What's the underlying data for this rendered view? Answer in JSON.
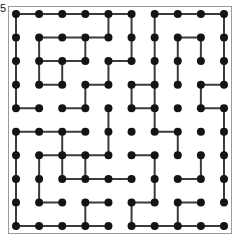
{
  "figure": {
    "caption": "5",
    "grid": {
      "rows": 10,
      "cols": 10,
      "origin_x": 14,
      "origin_y": 14,
      "step_x": 22.0,
      "step_y": 22.2
    },
    "style": {
      "dot_color": "#141414",
      "edge_color": "#3b3b3b",
      "frame_color": "#9a9a9a",
      "background": "#ffffff",
      "dot_radius": 4.0,
      "edge_width": 2.0
    },
    "chart_data": {
      "type": "scatter",
      "title": "Dot lattice maze diagram",
      "xlabel": "",
      "ylabel": "",
      "xlim": [
        0,
        9
      ],
      "ylim": [
        0,
        9
      ],
      "grid": false,
      "legend": "none",
      "note": "10x10 lattice of filled dots; selected orthogonal unit segments join neighbouring dots forming a maze-like pattern.",
      "nodes_per_row": 10,
      "nodes_per_col": 10,
      "horizontal_edges": [
        {
          "row": 0,
          "from": 0,
          "to": 5
        },
        {
          "row": 0,
          "from": 6,
          "to": 9
        },
        {
          "row": 1,
          "from": 1,
          "to": 4
        },
        {
          "row": 1,
          "from": 7,
          "to": 8
        },
        {
          "row": 2,
          "from": 1,
          "to": 3
        },
        {
          "row": 2,
          "from": 4,
          "to": 5
        },
        {
          "row": 3,
          "from": 1,
          "to": 2
        },
        {
          "row": 3,
          "from": 3,
          "to": 4
        },
        {
          "row": 3,
          "from": 5,
          "to": 6
        },
        {
          "row": 3,
          "from": 8,
          "to": 9
        },
        {
          "row": 4,
          "from": 0,
          "to": 1
        },
        {
          "row": 4,
          "from": 2,
          "to": 3
        },
        {
          "row": 4,
          "from": 5,
          "to": 6
        },
        {
          "row": 4,
          "from": 8,
          "to": 9
        },
        {
          "row": 5,
          "from": 0,
          "to": 3
        },
        {
          "row": 5,
          "from": 6,
          "to": 7
        },
        {
          "row": 6,
          "from": 1,
          "to": 4
        },
        {
          "row": 6,
          "from": 5,
          "to": 6
        },
        {
          "row": 7,
          "from": 2,
          "to": 5
        },
        {
          "row": 7,
          "from": 7,
          "to": 8
        },
        {
          "row": 8,
          "from": 1,
          "to": 2
        },
        {
          "row": 8,
          "from": 3,
          "to": 4
        },
        {
          "row": 8,
          "from": 5,
          "to": 6
        },
        {
          "row": 8,
          "from": 7,
          "to": 8
        },
        {
          "row": 9,
          "from": 0,
          "to": 4
        },
        {
          "row": 9,
          "from": 5,
          "to": 9
        }
      ],
      "vertical_edges": [
        {
          "col": 0,
          "from": 0,
          "to": 4
        },
        {
          "col": 0,
          "from": 5,
          "to": 9
        },
        {
          "col": 1,
          "from": 1,
          "to": 3
        },
        {
          "col": 1,
          "from": 6,
          "to": 8
        },
        {
          "col": 2,
          "from": 2,
          "to": 3
        },
        {
          "col": 2,
          "from": 5,
          "to": 7
        },
        {
          "col": 3,
          "from": 1,
          "to": 2
        },
        {
          "col": 3,
          "from": 3,
          "to": 4
        },
        {
          "col": 3,
          "from": 6,
          "to": 7
        },
        {
          "col": 3,
          "from": 8,
          "to": 9
        },
        {
          "col": 4,
          "from": 0,
          "to": 1
        },
        {
          "col": 4,
          "from": 2,
          "to": 3
        },
        {
          "col": 4,
          "from": 4,
          "to": 6
        },
        {
          "col": 5,
          "from": 0,
          "to": 2
        },
        {
          "col": 5,
          "from": 3,
          "to": 4
        },
        {
          "col": 5,
          "from": 8,
          "to": 9
        },
        {
          "col": 6,
          "from": 0,
          "to": 5
        },
        {
          "col": 6,
          "from": 6,
          "to": 8
        },
        {
          "col": 7,
          "from": 1,
          "to": 3
        },
        {
          "col": 7,
          "from": 5,
          "to": 6
        },
        {
          "col": 7,
          "from": 8,
          "to": 9
        },
        {
          "col": 8,
          "from": 1,
          "to": 2
        },
        {
          "col": 8,
          "from": 3,
          "to": 4
        },
        {
          "col": 8,
          "from": 6,
          "to": 7
        },
        {
          "col": 9,
          "from": 0,
          "to": 3
        },
        {
          "col": 9,
          "from": 4,
          "to": 8
        }
      ]
    }
  }
}
